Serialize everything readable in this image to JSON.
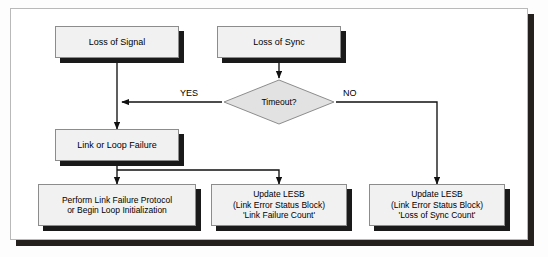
{
  "diagram": {
    "type": "flowchart",
    "colors": {
      "node_fill": "#f1f1f1",
      "node_border": "#8c8c8c",
      "decision_fill": "#e2e2e2",
      "shadow": "#1a1a1a",
      "frame_border": "#b9b9b9",
      "frame_shadow": "#23201e",
      "line": "#111111",
      "background": "#ffffff"
    },
    "nodes": {
      "loss_of_signal": {
        "label": "Loss of Signal",
        "shape": "process"
      },
      "loss_of_sync": {
        "label": "Loss of Sync",
        "shape": "process"
      },
      "timeout": {
        "label": "Timeout?",
        "shape": "decision"
      },
      "link_or_loop_failure": {
        "label": "Link or Loop Failure",
        "shape": "process"
      },
      "perform_link_failure": {
        "label": "Perform Link Failure  Protocol\nor Begin Loop Initialization",
        "shape": "process"
      },
      "update_lesb_link_failure": {
        "label": "Update LESB\n(Link Error Status Block)\n'Link Failure Count'",
        "shape": "process"
      },
      "update_lesb_loss_of_sync": {
        "label": "Update LESB\n(Link Error Status Block)\n'Loss of Sync Count'",
        "shape": "process"
      }
    },
    "edge_labels": {
      "yes": "YES",
      "no": "NO"
    },
    "edges": [
      {
        "from": "loss_of_signal",
        "to": "link_or_loop_failure",
        "label": ""
      },
      {
        "from": "loss_of_sync",
        "to": "timeout",
        "label": ""
      },
      {
        "from": "timeout",
        "to": "link_or_loop_failure",
        "label": "YES"
      },
      {
        "from": "timeout",
        "to": "update_lesb_loss_of_sync",
        "label": "NO"
      },
      {
        "from": "link_or_loop_failure",
        "to": "perform_link_failure",
        "label": ""
      },
      {
        "from": "link_or_loop_failure",
        "to": "update_lesb_link_failure",
        "label": ""
      }
    ]
  }
}
